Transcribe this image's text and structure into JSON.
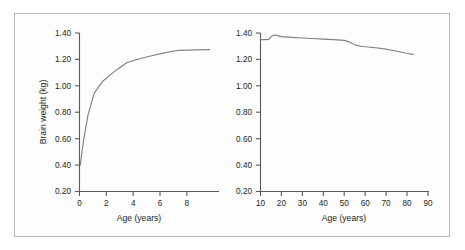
{
  "figure": {
    "background_color": "#fdfdfd",
    "border_color": "#b9b9b9",
    "axis_color": "#58595b",
    "curve_color": "#7e8083",
    "text_color": "#231f20"
  },
  "chart_data": [
    {
      "type": "line",
      "title": "",
      "xlabel": "Age (years)",
      "ylabel": "Brain weight (kg)",
      "xlim": [
        0,
        9
      ],
      "ylim": [
        0.2,
        1.4
      ],
      "xticks": [
        0,
        2,
        4,
        6,
        8
      ],
      "xtick_labels": [
        "0",
        "2",
        "4",
        "6",
        "8"
      ],
      "yticks": [
        0.2,
        0.4,
        0.6,
        0.8,
        1.0,
        1.2,
        1.4
      ],
      "ytick_labels": [
        "0.20",
        "0.40",
        "0.60",
        "0.80",
        "1.00",
        "1.20",
        "1.40"
      ],
      "grid": false,
      "legend": false,
      "series": [
        {
          "name": "Brain weight birth to 8 years",
          "x": [
            0.05,
            0.25,
            0.55,
            0.95,
            1.5,
            2.0,
            2.5,
            3.05,
            3.6,
            4.2,
            4.8,
            5.4,
            6.0,
            6.4,
            7.0,
            7.6,
            8.4
          ],
          "y": [
            0.4,
            0.58,
            0.78,
            0.945,
            1.035,
            1.085,
            1.13,
            1.175,
            1.196,
            1.215,
            1.232,
            1.248,
            1.262,
            1.268,
            1.27,
            1.272,
            1.274
          ]
        }
      ]
    },
    {
      "type": "line",
      "title": "",
      "xlabel": "Age (years)",
      "ylabel": "Brain weight (kg)",
      "xlim": [
        10,
        90
      ],
      "ylim": [
        0.2,
        1.4
      ],
      "xticks": [
        10,
        20,
        30,
        40,
        50,
        60,
        70,
        80,
        90
      ],
      "xtick_labels": [
        "10",
        "20",
        "30",
        "40",
        "50",
        "60",
        "70",
        "80",
        "90"
      ],
      "yticks": [
        0.2,
        0.4,
        0.6,
        0.8,
        1.0,
        1.2,
        1.4
      ],
      "ytick_labels": [
        "0.20",
        "0.40",
        "0.60",
        "0.80",
        "1.00",
        "1.20",
        "1.40"
      ],
      "grid": false,
      "legend": false,
      "series": [
        {
          "name": "Brain weight 10 to 85 years",
          "x": [
            10,
            12,
            14,
            15,
            16,
            17,
            18,
            20,
            25,
            30,
            35,
            40,
            45,
            50,
            52,
            54,
            56,
            58,
            60,
            65,
            70,
            75,
            78,
            80,
            83
          ],
          "y": [
            1.35,
            1.35,
            1.352,
            1.372,
            1.382,
            1.385,
            1.38,
            1.373,
            1.367,
            1.362,
            1.358,
            1.354,
            1.35,
            1.344,
            1.335,
            1.318,
            1.306,
            1.3,
            1.296,
            1.288,
            1.278,
            1.262,
            1.252,
            1.245,
            1.238
          ]
        }
      ]
    }
  ]
}
